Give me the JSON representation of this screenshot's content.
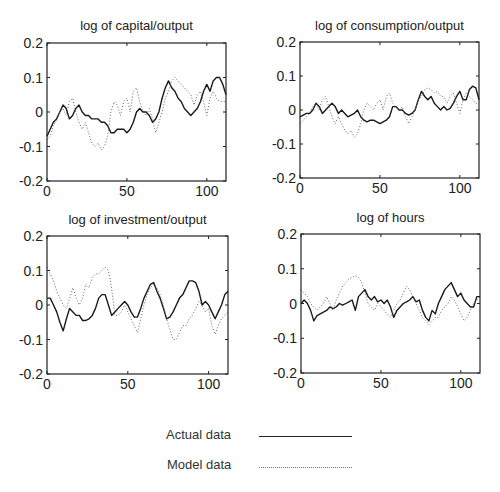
{
  "legend": {
    "actual_label": "Actual data",
    "model_label": "Model data"
  },
  "chart_data": [
    {
      "type": "line",
      "title": "log of capital/output",
      "xlabel": "",
      "ylabel": "",
      "xlim": [
        0,
        112
      ],
      "ylim": [
        -0.2,
        0.2
      ],
      "xticks": [
        0,
        50,
        100
      ],
      "yticks": [
        -0.2,
        -0.1,
        0,
        0.1,
        0.2
      ],
      "ytick_labels": [
        "-0.2",
        "-0.1",
        "0",
        "0.1",
        "0.2"
      ],
      "xtick_labels": [
        "0",
        "50",
        "100"
      ],
      "grid": false,
      "series": [
        {
          "name": "Actual data",
          "style": "solid",
          "x": [
            0,
            2,
            4,
            6,
            8,
            10,
            12,
            14,
            16,
            18,
            20,
            22,
            24,
            26,
            28,
            30,
            32,
            34,
            36,
            38,
            40,
            42,
            44,
            46,
            48,
            50,
            52,
            54,
            56,
            58,
            60,
            62,
            64,
            66,
            68,
            70,
            72,
            74,
            76,
            78,
            80,
            82,
            84,
            86,
            88,
            90,
            92,
            94,
            96,
            98,
            100,
            102,
            104,
            106,
            108,
            110,
            112
          ],
          "values": [
            -0.07,
            -0.05,
            -0.03,
            -0.02,
            0.0,
            0.02,
            0.01,
            -0.02,
            -0.01,
            0.01,
            0.02,
            0.0,
            -0.01,
            -0.01,
            -0.02,
            -0.02,
            -0.02,
            -0.03,
            -0.03,
            -0.04,
            -0.06,
            -0.06,
            -0.05,
            -0.05,
            -0.05,
            -0.06,
            -0.05,
            -0.03,
            0.0,
            0.01,
            0.0,
            0.0,
            -0.01,
            -0.03,
            -0.02,
            0.0,
            0.04,
            0.07,
            0.09,
            0.07,
            0.06,
            0.04,
            0.03,
            0.01,
            0.0,
            -0.01,
            0.0,
            0.01,
            0.03,
            0.06,
            0.08,
            0.06,
            0.09,
            0.1,
            0.1,
            0.08,
            0.05
          ]
        },
        {
          "name": "Model data",
          "style": "dotted",
          "x": [
            0,
            2,
            4,
            6,
            8,
            10,
            12,
            14,
            16,
            18,
            20,
            22,
            24,
            26,
            28,
            30,
            32,
            34,
            36,
            38,
            40,
            42,
            44,
            46,
            48,
            50,
            52,
            54,
            56,
            58,
            60,
            62,
            64,
            66,
            68,
            70,
            72,
            74,
            76,
            78,
            80,
            82,
            84,
            86,
            88,
            90,
            92,
            94,
            96,
            98,
            100,
            102,
            104,
            106,
            108,
            110,
            112
          ],
          "values": [
            -0.08,
            -0.07,
            -0.04,
            -0.02,
            0.0,
            0.01,
            -0.01,
            0.03,
            0.04,
            0.0,
            -0.03,
            -0.05,
            -0.03,
            -0.06,
            -0.09,
            -0.1,
            -0.09,
            -0.11,
            -0.1,
            -0.07,
            0.0,
            0.03,
            0.02,
            -0.01,
            0.03,
            0.04,
            0.0,
            0.06,
            0.07,
            0.03,
            0.0,
            -0.01,
            0.01,
            -0.02,
            -0.06,
            -0.03,
            0.0,
            0.04,
            0.06,
            0.09,
            0.1,
            0.09,
            0.08,
            0.07,
            0.06,
            0.05,
            0.02,
            0.05,
            0.06,
            0.03,
            -0.01,
            0.04,
            0.06,
            0.04,
            0.03,
            0.03,
            0.03
          ]
        }
      ]
    },
    {
      "type": "line",
      "title": "log of consumption/output",
      "xlabel": "",
      "ylabel": "",
      "xlim": [
        0,
        112
      ],
      "ylim": [
        -0.2,
        0.2
      ],
      "xticks": [
        0,
        50,
        100
      ],
      "yticks": [
        -0.2,
        -0.1,
        0,
        0.1,
        0.2
      ],
      "ytick_labels": [
        "-0.2",
        "-0.1",
        "0",
        "0.1",
        "0.2"
      ],
      "xtick_labels": [
        "0",
        "50",
        "100"
      ],
      "grid": false,
      "series": [
        {
          "name": "Actual data",
          "style": "solid",
          "x": [
            0,
            2,
            4,
            6,
            8,
            10,
            12,
            14,
            16,
            18,
            20,
            22,
            24,
            26,
            28,
            30,
            32,
            34,
            36,
            38,
            40,
            42,
            44,
            46,
            48,
            50,
            52,
            54,
            56,
            58,
            60,
            62,
            64,
            66,
            68,
            70,
            72,
            74,
            76,
            78,
            80,
            82,
            84,
            86,
            88,
            90,
            92,
            94,
            96,
            98,
            100,
            102,
            104,
            106,
            108,
            110,
            112
          ],
          "values": [
            -0.02,
            -0.015,
            -0.01,
            -0.01,
            0.0,
            0.02,
            0.01,
            -0.01,
            0.0,
            0.01,
            0.02,
            0.01,
            -0.01,
            0.0,
            -0.01,
            -0.02,
            -0.015,
            -0.01,
            0.0,
            -0.02,
            -0.03,
            -0.035,
            -0.03,
            -0.03,
            -0.035,
            -0.04,
            -0.035,
            -0.03,
            -0.02,
            0.01,
            0.01,
            0.0,
            0.0,
            -0.01,
            -0.015,
            -0.01,
            0.0,
            0.03,
            0.055,
            0.04,
            0.03,
            0.04,
            0.02,
            0.01,
            0.0,
            0.01,
            0.0,
            0.005,
            0.02,
            0.04,
            0.055,
            0.03,
            0.03,
            0.06,
            0.07,
            0.065,
            0.03
          ]
        },
        {
          "name": "Model data",
          "style": "dotted",
          "x": [
            0,
            2,
            4,
            6,
            8,
            10,
            12,
            14,
            16,
            18,
            20,
            22,
            24,
            26,
            28,
            30,
            32,
            34,
            36,
            38,
            40,
            42,
            44,
            46,
            48,
            50,
            52,
            54,
            56,
            58,
            60,
            62,
            64,
            66,
            68,
            70,
            72,
            74,
            76,
            78,
            80,
            82,
            84,
            86,
            88,
            90,
            92,
            94,
            96,
            98,
            100,
            102,
            104,
            106,
            108,
            110,
            112
          ],
          "values": [
            -0.04,
            -0.03,
            -0.02,
            -0.01,
            0.01,
            0.02,
            0.0,
            0.03,
            0.04,
            0.01,
            -0.02,
            -0.04,
            -0.02,
            -0.04,
            -0.06,
            -0.07,
            -0.06,
            -0.08,
            -0.07,
            -0.04,
            0.0,
            0.02,
            0.01,
            0.0,
            0.02,
            0.03,
            0.0,
            0.04,
            0.05,
            0.02,
            0.01,
            0.0,
            0.01,
            -0.02,
            -0.04,
            -0.02,
            0.0,
            0.03,
            0.04,
            0.06,
            0.065,
            0.06,
            0.05,
            0.055,
            0.04,
            0.04,
            0.02,
            0.04,
            0.05,
            0.02,
            -0.01,
            0.03,
            0.05,
            0.04,
            0.03,
            0.02,
            0.02
          ]
        }
      ]
    },
    {
      "type": "line",
      "title": "log of investment/output",
      "xlabel": "",
      "ylabel": "",
      "xlim": [
        0,
        112
      ],
      "ylim": [
        -0.2,
        0.2
      ],
      "xticks": [
        0,
        50,
        100
      ],
      "yticks": [
        -0.2,
        -0.1,
        0,
        0.1,
        0.2
      ],
      "ytick_labels": [
        "-0.2",
        "-0.1",
        "0",
        "0.1",
        "0.2"
      ],
      "xtick_labels": [
        "0",
        "50",
        "100"
      ],
      "grid": false,
      "series": [
        {
          "name": "Actual data",
          "style": "solid",
          "x": [
            0,
            2,
            4,
            6,
            8,
            10,
            12,
            14,
            16,
            18,
            20,
            22,
            24,
            26,
            28,
            30,
            32,
            34,
            36,
            38,
            40,
            42,
            44,
            46,
            48,
            50,
            52,
            54,
            56,
            58,
            60,
            62,
            64,
            66,
            68,
            70,
            72,
            74,
            76,
            78,
            80,
            82,
            84,
            86,
            88,
            90,
            92,
            94,
            96,
            98,
            100,
            102,
            104,
            106,
            108,
            110,
            112
          ],
          "values": [
            0.02,
            0.02,
            0.0,
            -0.02,
            -0.05,
            -0.075,
            -0.04,
            -0.01,
            -0.02,
            -0.03,
            -0.03,
            -0.045,
            -0.045,
            -0.04,
            -0.03,
            -0.01,
            0.02,
            0.03,
            0.03,
            0.0,
            -0.03,
            -0.02,
            -0.01,
            0.0,
            0.01,
            0.0,
            -0.02,
            -0.035,
            -0.035,
            -0.01,
            0.02,
            0.04,
            0.06,
            0.065,
            0.04,
            0.02,
            -0.01,
            -0.04,
            -0.035,
            -0.02,
            0.0,
            0.02,
            0.03,
            0.05,
            0.07,
            0.07,
            0.065,
            0.04,
            0.0,
            0.01,
            0.0,
            -0.02,
            -0.04,
            -0.02,
            0.0,
            0.03,
            0.04
          ]
        },
        {
          "name": "Model data",
          "style": "dotted",
          "x": [
            0,
            2,
            4,
            6,
            8,
            10,
            12,
            14,
            16,
            18,
            20,
            22,
            24,
            26,
            28,
            30,
            32,
            34,
            36,
            38,
            40,
            42,
            44,
            46,
            48,
            50,
            52,
            54,
            56,
            58,
            60,
            62,
            64,
            66,
            68,
            70,
            72,
            74,
            76,
            78,
            80,
            82,
            84,
            86,
            88,
            90,
            92,
            94,
            96,
            98,
            100,
            102,
            104,
            106,
            108,
            110,
            112
          ],
          "values": [
            0.11,
            0.09,
            0.07,
            0.04,
            0.02,
            0.0,
            -0.01,
            0.02,
            0.05,
            0.02,
            0.0,
            0.02,
            0.06,
            0.05,
            0.08,
            0.09,
            0.09,
            0.1,
            0.11,
            0.1,
            0.05,
            -0.03,
            -0.03,
            -0.02,
            0.0,
            -0.02,
            -0.04,
            -0.06,
            -0.08,
            -0.04,
            0.0,
            0.03,
            0.05,
            0.06,
            0.05,
            0.03,
            0.0,
            -0.04,
            -0.07,
            -0.1,
            -0.1,
            -0.08,
            -0.06,
            -0.06,
            -0.04,
            -0.03,
            -0.01,
            0.01,
            0.0,
            -0.02,
            -0.01,
            -0.06,
            -0.085,
            -0.06,
            -0.04,
            -0.03,
            -0.02
          ]
        }
      ]
    },
    {
      "type": "line",
      "title": "log of hours",
      "xlabel": "",
      "ylabel": "",
      "xlim": [
        0,
        112
      ],
      "ylim": [
        -0.2,
        0.2
      ],
      "xticks": [
        0,
        50,
        100
      ],
      "yticks": [
        -0.2,
        -0.1,
        0,
        0.1,
        0.2
      ],
      "ytick_labels": [
        "-0.2",
        "-0.1",
        "0",
        "0.1",
        "0.2"
      ],
      "xtick_labels": [
        "0",
        "50",
        "100"
      ],
      "grid": false,
      "series": [
        {
          "name": "Actual data",
          "style": "solid",
          "x": [
            0,
            2,
            4,
            6,
            8,
            10,
            12,
            14,
            16,
            18,
            20,
            22,
            24,
            26,
            28,
            30,
            32,
            34,
            36,
            38,
            40,
            42,
            44,
            46,
            48,
            50,
            52,
            54,
            56,
            58,
            60,
            62,
            64,
            66,
            68,
            70,
            72,
            74,
            76,
            78,
            80,
            82,
            84,
            86,
            88,
            90,
            92,
            94,
            96,
            98,
            100,
            102,
            104,
            106,
            108,
            110,
            112
          ],
          "values": [
            0.0,
            0.01,
            0.0,
            -0.02,
            -0.05,
            -0.035,
            -0.03,
            -0.025,
            -0.02,
            -0.01,
            -0.015,
            -0.01,
            0.0,
            -0.005,
            0.0,
            0.005,
            0.01,
            -0.02,
            0.02,
            0.03,
            0.04,
            0.02,
            0.01,
            0.02,
            0.005,
            0.01,
            0.0,
            0.01,
            -0.01,
            -0.04,
            -0.02,
            -0.01,
            0.0,
            0.005,
            0.01,
            0.02,
            0.005,
            0.01,
            -0.02,
            -0.04,
            -0.05,
            -0.02,
            -0.03,
            0.0,
            0.02,
            0.04,
            0.05,
            0.06,
            0.04,
            0.02,
            0.03,
            0.01,
            0.0,
            -0.01,
            -0.01,
            0.02,
            0.02
          ]
        },
        {
          "name": "Model data",
          "style": "dotted",
          "x": [
            0,
            2,
            4,
            6,
            8,
            10,
            12,
            14,
            16,
            18,
            20,
            22,
            24,
            26,
            28,
            30,
            32,
            34,
            36,
            38,
            40,
            42,
            44,
            46,
            48,
            50,
            52,
            54,
            56,
            58,
            60,
            62,
            64,
            66,
            68,
            70,
            72,
            74,
            76,
            78,
            80,
            82,
            84,
            86,
            88,
            90,
            92,
            94,
            96,
            98,
            100,
            102,
            104,
            106,
            108,
            110,
            112
          ],
          "values": [
            0.04,
            0.03,
            0.02,
            0.0,
            -0.01,
            -0.02,
            -0.01,
            0.0,
            0.02,
            0.0,
            -0.02,
            0.01,
            0.03,
            0.05,
            0.06,
            0.07,
            0.075,
            0.08,
            0.075,
            0.06,
            0.03,
            0.0,
            -0.01,
            -0.02,
            0.0,
            -0.01,
            -0.02,
            -0.03,
            -0.04,
            -0.02,
            0.0,
            0.01,
            0.03,
            0.05,
            0.04,
            0.02,
            0.0,
            -0.02,
            -0.04,
            -0.05,
            -0.06,
            -0.05,
            -0.04,
            -0.04,
            -0.02,
            -0.01,
            0.0,
            0.02,
            0.01,
            -0.01,
            -0.03,
            -0.05,
            -0.04,
            -0.02,
            0.0,
            0.01,
            0.02
          ]
        }
      ]
    }
  ]
}
